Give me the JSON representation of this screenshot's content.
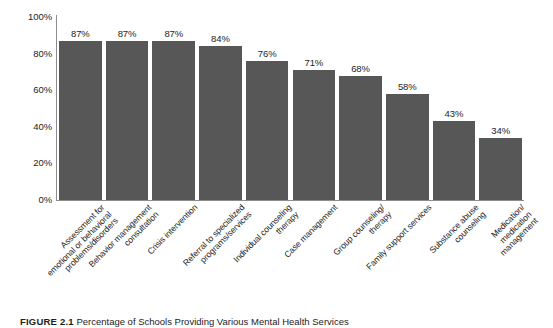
{
  "figure": {
    "caption_label": "FIGURE 2.1",
    "caption_text": "Percentage of Schools Providing Various Mental Health Services",
    "bar_color": "#575757",
    "axis_color": "#8c8c8c",
    "background": "#ffffff"
  },
  "chart_data": {
    "type": "bar",
    "title": "Percentage of Schools Providing Various Mental Health Services",
    "xlabel": "",
    "ylabel": "",
    "ylim": [
      0,
      100
    ],
    "grid": false,
    "legend": "none",
    "y_ticks": [
      "0%",
      "20%",
      "40%",
      "60%",
      "80%",
      "100%"
    ],
    "y_tick_values": [
      0,
      20,
      40,
      60,
      80,
      100
    ],
    "categories": [
      "Assessment for emotional or behavioral problems/disorders",
      "Behavior management consultation",
      "Crisis intervention",
      "Referral to specialized programs/services",
      "Individual counseling therapy",
      "Case management",
      "Group counseling/ therapy",
      "Family support services",
      "Substance abuse counseling",
      "Medication/ medication management"
    ],
    "category_lines": [
      [
        "Assessment for",
        "emotional or behavioral",
        "problems/disorders"
      ],
      [
        "Behavior management",
        "consultation"
      ],
      [
        "Crisis intervention"
      ],
      [
        "Referral to specialized",
        "programs/services"
      ],
      [
        "Individual counseling",
        "therapy"
      ],
      [
        "Case management"
      ],
      [
        "Group counseling/",
        "therapy"
      ],
      [
        "Family support services"
      ],
      [
        "Substance abuse",
        "counseling"
      ],
      [
        "Medication/",
        "medication",
        "management"
      ]
    ],
    "values": [
      87,
      87,
      87,
      84,
      76,
      71,
      68,
      58,
      43,
      34
    ],
    "value_labels": [
      "87%",
      "87%",
      "87%",
      "84%",
      "76%",
      "71%",
      "68%",
      "58%",
      "43%",
      "34%"
    ]
  }
}
